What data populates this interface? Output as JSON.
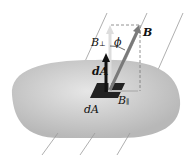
{
  "diagram": {
    "labels": {
      "B": "B",
      "B_perp": "B",
      "B_perp_sub": "⊥",
      "phi": "ϕ",
      "dA_vector": "dA",
      "dA_area": "dA",
      "B_par": "B",
      "B_par_sub": "∥"
    },
    "colors": {
      "surface": "#c8c8c8",
      "field_lines": "#9a9a9a",
      "B_vector": "#7a7a7a",
      "dA_vector": "#111111",
      "area_element": "#222222"
    }
  }
}
